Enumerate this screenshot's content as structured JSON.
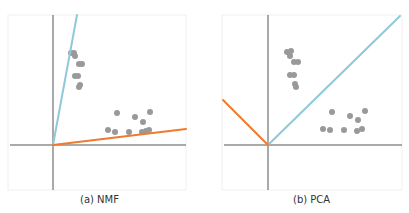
{
  "figure": {
    "panels": [
      {
        "id": "nmf",
        "caption": "(a) NMF",
        "frame": {
          "x": 8,
          "y": 15,
          "w": 178,
          "h": 175
        },
        "origin": [
          53,
          145
        ],
        "x_axis": {
          "x1": 10,
          "x2": 186
        },
        "y_axis": {
          "y1": 15,
          "y2": 190
        },
        "component_lines": [
          {
            "name": "component-1",
            "color": "#8fc9d9",
            "x2": 77,
            "y2": 15
          },
          {
            "name": "component-2",
            "color": "#f07a2d",
            "x2": 186,
            "y2": 129
          }
        ],
        "points": [
          [
            71,
            53
          ],
          [
            74,
            53
          ],
          [
            75,
            56
          ],
          [
            79,
            64
          ],
          [
            82,
            64
          ],
          [
            75,
            76
          ],
          [
            78,
            76
          ],
          [
            80,
            85
          ],
          [
            79,
            87
          ],
          [
            117,
            113
          ],
          [
            135,
            117
          ],
          [
            150,
            112
          ],
          [
            143,
            122
          ],
          [
            108,
            130
          ],
          [
            115,
            132
          ],
          [
            129,
            132
          ],
          [
            142,
            132
          ],
          [
            146,
            131
          ],
          [
            149,
            130
          ]
        ]
      },
      {
        "id": "pca",
        "caption": "(b) PCA",
        "frame": {
          "x": 222,
          "y": 15,
          "w": 180,
          "h": 175
        },
        "origin": [
          268,
          145
        ],
        "x_axis": {
          "x1": 224,
          "x2": 402
        },
        "y_axis": {
          "y1": 15,
          "y2": 190
        },
        "component_lines": [
          {
            "name": "component-1",
            "color": "#8fc9d9",
            "x2": 400,
            "y2": 16
          },
          {
            "name": "component-2",
            "color": "#f07a2d",
            "x2": 223,
            "y2": 100
          }
        ],
        "points": [
          [
            287,
            52
          ],
          [
            291,
            51
          ],
          [
            290,
            56
          ],
          [
            294,
            62
          ],
          [
            298,
            62
          ],
          [
            290,
            75
          ],
          [
            294,
            75
          ],
          [
            295,
            84
          ],
          [
            296,
            87
          ],
          [
            332,
            112
          ],
          [
            350,
            116
          ],
          [
            365,
            111
          ],
          [
            358,
            120
          ],
          [
            323,
            129
          ],
          [
            330,
            130
          ],
          [
            344,
            130
          ],
          [
            357,
            131
          ],
          [
            362,
            129
          ]
        ]
      }
    ],
    "colors": {
      "axis": "#555555",
      "point": "#999999",
      "frame": "#f0f0f0"
    }
  }
}
